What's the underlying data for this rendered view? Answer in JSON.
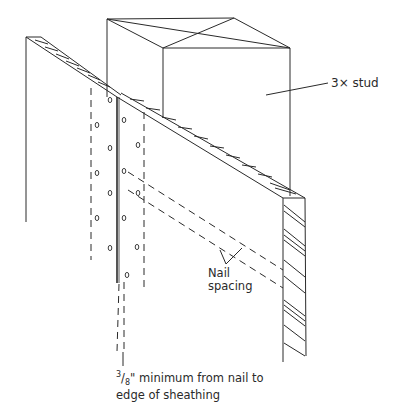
{
  "diagram": {
    "labels": {
      "stud": "3× stud",
      "nail_spacing_line1": "Nail",
      "nail_spacing_line2": "spacing",
      "edge_note_fraction_num": "3",
      "edge_note_fraction_den": "8",
      "edge_note_line1_rest": "\" minimum from nail to",
      "edge_note_line2": "edge of sheathing"
    },
    "colors": {
      "line": "#2a2a2a",
      "background": "#ffffff"
    }
  }
}
